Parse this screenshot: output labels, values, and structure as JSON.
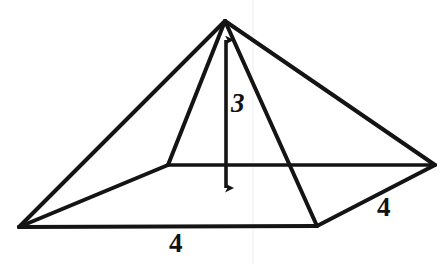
{
  "figure": {
    "background_color": "#ffffff",
    "stroke_color": "#141414",
    "labels": {
      "height": "3",
      "base_front": "4",
      "base_right": "4"
    },
    "geometry": {
      "apex": [
        225,
        21
      ],
      "base_left": [
        19,
        227
      ],
      "base_front": [
        317,
        226
      ],
      "base_right": [
        435,
        165
      ],
      "base_back": [
        168,
        165
      ],
      "height_arrow": {
        "x": 226,
        "y_top": 33,
        "y_bottom": 196,
        "double_headed": true
      }
    },
    "edges": [
      {
        "name": "apex-to-base-left",
        "from": [
          225,
          21
        ],
        "to": [
          19,
          227
        ],
        "style": "solid"
      },
      {
        "name": "apex-to-base-front",
        "from": [
          225,
          21
        ],
        "to": [
          317,
          226
        ],
        "style": "solid"
      },
      {
        "name": "apex-to-base-right",
        "from": [
          225,
          21
        ],
        "to": [
          435,
          165
        ],
        "style": "solid"
      },
      {
        "name": "apex-to-base-back",
        "from": [
          225,
          21
        ],
        "to": [
          168,
          165
        ],
        "style": "solid"
      },
      {
        "name": "base-left-to-base-front",
        "from": [
          19,
          227
        ],
        "to": [
          317,
          226
        ],
        "style": "solid"
      },
      {
        "name": "base-front-to-base-right",
        "from": [
          317,
          226
        ],
        "to": [
          435,
          165
        ],
        "style": "solid"
      },
      {
        "name": "base-right-to-base-back",
        "from": [
          435,
          165
        ],
        "to": [
          168,
          165
        ],
        "style": "solid"
      },
      {
        "name": "base-back-to-base-left",
        "from": [
          168,
          165
        ],
        "to": [
          19,
          227
        ],
        "style": "solid"
      }
    ]
  }
}
